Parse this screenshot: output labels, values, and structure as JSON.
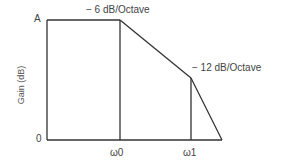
{
  "diagram": {
    "y_axis_label": "Gain (dB)",
    "y_ticks": {
      "top": "A",
      "bottom": "0"
    },
    "x_ticks": [
      "ω0",
      "ω1"
    ],
    "annotations": {
      "slope1": "− 6 dB/Octave",
      "slope2": "− 12 dB/Octave"
    },
    "line_color": "#333333",
    "points": {
      "origin": [
        47,
        140
      ],
      "top_left": [
        47,
        20
      ],
      "w0_top": [
        120,
        20
      ],
      "w0_bottom": [
        120,
        140
      ],
      "w1_top": [
        191,
        78
      ],
      "w1_bottom": [
        191,
        140
      ],
      "end": [
        222,
        140
      ]
    }
  }
}
